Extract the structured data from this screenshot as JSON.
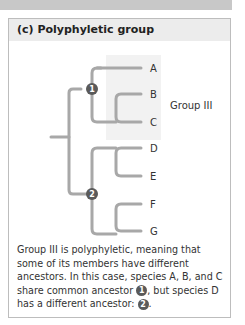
{
  "panel": {
    "title": "(c) Polyphyletic group"
  },
  "tree": {
    "leaves": [
      "A",
      "B",
      "C",
      "D",
      "E",
      "F",
      "G"
    ],
    "nodes": [
      "1",
      "2"
    ],
    "group_label": "Group III",
    "colors": {
      "branch": "#a8a8a8",
      "node": "#5a5a5a",
      "highlight": "#f2f2f2",
      "text": "#333333"
    }
  },
  "caption": {
    "part1": "Group III is polyphyletic, meaning that some of its members have different ancestors. In this case, species A, B, and C share common ancestor ",
    "node1": "1",
    "part2": ", but species D has a different ancestor: ",
    "node2": "2",
    "part3": "."
  }
}
